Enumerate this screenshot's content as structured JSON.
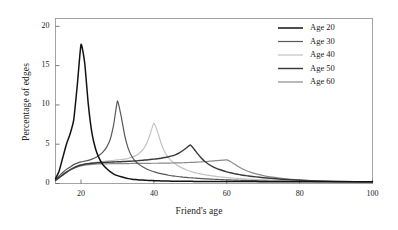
{
  "chart_data": {
    "type": "line",
    "title": "",
    "xlabel": "Friend's age",
    "ylabel": "Percentage of edges",
    "xlim": [
      13,
      100
    ],
    "ylim": [
      0,
      21
    ],
    "xticks": [
      20,
      40,
      60,
      80,
      100
    ],
    "yticks": [
      0,
      5,
      10,
      15,
      20
    ],
    "grid": false,
    "legend_position": "top-right",
    "x": [
      13,
      14,
      15,
      16,
      17,
      18,
      19,
      20,
      21,
      22,
      23,
      24,
      25,
      26,
      27,
      28,
      29,
      30,
      31,
      32,
      33,
      34,
      35,
      36,
      37,
      38,
      39,
      40,
      41,
      42,
      43,
      44,
      45,
      46,
      47,
      48,
      49,
      50,
      51,
      52,
      53,
      54,
      55,
      56,
      57,
      58,
      59,
      60,
      61,
      62,
      63,
      64,
      65,
      66,
      68,
      70,
      72,
      75,
      80,
      85,
      90,
      95,
      100
    ],
    "series": [
      {
        "name": "Age 20",
        "color": "#131313",
        "width": 1.5,
        "peak_x": 20,
        "peak_y": 17.7,
        "values": [
          0.6,
          1.6,
          3.3,
          5.0,
          6.3,
          8.1,
          12.6,
          17.7,
          15.4,
          10.1,
          6.4,
          4.4,
          3.2,
          2.4,
          1.9,
          1.5,
          1.2,
          1.0,
          0.85,
          0.72,
          0.62,
          0.55,
          0.5,
          0.46,
          0.43,
          0.4,
          0.38,
          0.36,
          0.34,
          0.33,
          0.32,
          0.31,
          0.3,
          0.3,
          0.29,
          0.29,
          0.28,
          0.28,
          0.27,
          0.27,
          0.27,
          0.26,
          0.26,
          0.26,
          0.26,
          0.25,
          0.25,
          0.25,
          0.25,
          0.25,
          0.24,
          0.24,
          0.24,
          0.24,
          0.24,
          0.23,
          0.23,
          0.23,
          0.22,
          0.22,
          0.22,
          0.21,
          0.21
        ]
      },
      {
        "name": "Age 30",
        "color": "#585858",
        "width": 1.2,
        "peak_x": 30,
        "peak_y": 10.5,
        "values": [
          0.5,
          0.95,
          1.4,
          1.8,
          2.1,
          2.4,
          2.6,
          2.75,
          2.85,
          2.95,
          3.1,
          3.3,
          3.6,
          4.0,
          4.6,
          5.6,
          7.6,
          10.5,
          8.6,
          6.1,
          4.4,
          3.4,
          2.8,
          2.4,
          2.1,
          1.85,
          1.65,
          1.5,
          1.35,
          1.25,
          1.15,
          1.05,
          0.98,
          0.92,
          0.86,
          0.81,
          0.77,
          0.73,
          0.7,
          0.66,
          0.63,
          0.6,
          0.58,
          0.55,
          0.53,
          0.51,
          0.49,
          0.47,
          0.45,
          0.44,
          0.42,
          0.41,
          0.4,
          0.38,
          0.36,
          0.34,
          0.32,
          0.3,
          0.27,
          0.25,
          0.23,
          0.22,
          0.21
        ]
      },
      {
        "name": "Age 40",
        "color": "#c2c2c2",
        "width": 1.2,
        "peak_x": 40,
        "peak_y": 7.7,
        "values": [
          0.45,
          0.8,
          1.15,
          1.5,
          1.8,
          2.05,
          2.25,
          2.4,
          2.5,
          2.58,
          2.65,
          2.7,
          2.75,
          2.8,
          2.85,
          2.9,
          2.95,
          3.0,
          3.05,
          3.1,
          3.2,
          3.35,
          3.55,
          3.85,
          4.3,
          5.1,
          6.3,
          7.7,
          6.6,
          5.1,
          4.0,
          3.3,
          2.8,
          2.45,
          2.15,
          1.92,
          1.72,
          1.56,
          1.42,
          1.3,
          1.2,
          1.11,
          1.03,
          0.96,
          0.9,
          0.85,
          0.8,
          0.76,
          0.72,
          0.68,
          0.65,
          0.62,
          0.59,
          0.56,
          0.51,
          0.47,
          0.43,
          0.38,
          0.31,
          0.27,
          0.24,
          0.22,
          0.21
        ]
      },
      {
        "name": "Age 50",
        "color": "#3a3a3a",
        "width": 1.45,
        "peak_x": 50,
        "peak_y": 4.9,
        "values": [
          0.4,
          0.75,
          1.1,
          1.45,
          1.75,
          2.0,
          2.2,
          2.35,
          2.45,
          2.52,
          2.58,
          2.62,
          2.65,
          2.68,
          2.7,
          2.72,
          2.74,
          2.76,
          2.78,
          2.8,
          2.82,
          2.85,
          2.88,
          2.92,
          2.96,
          3.0,
          3.05,
          3.1,
          3.16,
          3.22,
          3.3,
          3.4,
          3.52,
          3.68,
          3.9,
          4.2,
          4.55,
          4.9,
          4.4,
          3.8,
          3.25,
          2.8,
          2.45,
          2.18,
          1.96,
          1.78,
          1.62,
          1.48,
          1.36,
          1.26,
          1.17,
          1.09,
          1.02,
          0.95,
          0.84,
          0.74,
          0.66,
          0.55,
          0.41,
          0.32,
          0.26,
          0.23,
          0.21
        ]
      },
      {
        "name": "Age 60",
        "color": "#8a8a8a",
        "width": 1.2,
        "peak_x": 60,
        "peak_y": 3.0,
        "values": [
          0.38,
          0.72,
          1.05,
          1.38,
          1.68,
          1.92,
          2.1,
          2.24,
          2.33,
          2.4,
          2.44,
          2.47,
          2.49,
          2.5,
          2.51,
          2.52,
          2.52,
          2.53,
          2.53,
          2.54,
          2.54,
          2.55,
          2.55,
          2.56,
          2.56,
          2.57,
          2.57,
          2.58,
          2.58,
          2.59,
          2.6,
          2.6,
          2.61,
          2.62,
          2.63,
          2.64,
          2.66,
          2.68,
          2.7,
          2.72,
          2.75,
          2.78,
          2.82,
          2.86,
          2.9,
          2.94,
          2.98,
          3.0,
          2.8,
          2.5,
          2.2,
          1.95,
          1.72,
          1.52,
          1.22,
          1.0,
          0.84,
          0.66,
          0.45,
          0.33,
          0.26,
          0.23,
          0.21
        ]
      }
    ]
  },
  "axes": {
    "ylabel": "Percentage of edges",
    "xlabel": "Friend's age",
    "yticks": [
      "0",
      "5",
      "10",
      "15",
      "20"
    ],
    "xticks": [
      "20",
      "40",
      "60",
      "80",
      "100"
    ]
  },
  "legend": {
    "entries": [
      {
        "label": "Age 20"
      },
      {
        "label": "Age 30"
      },
      {
        "label": "Age 40"
      },
      {
        "label": "Age 50"
      },
      {
        "label": "Age 60"
      }
    ]
  }
}
